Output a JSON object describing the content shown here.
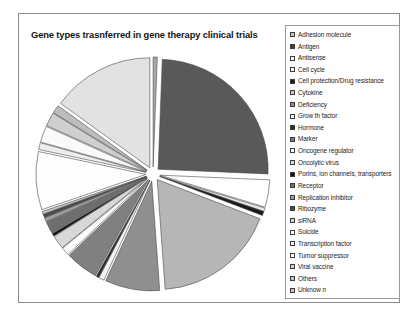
{
  "chart_data": {
    "type": "pie",
    "title": "Gene types  trasnferred in gene therapy clinical trials",
    "exploded": true,
    "legend_position": "right",
    "grid": false,
    "categories": [
      "Adhesion molecule",
      "Antigen",
      "Antisense",
      "Cell cycle",
      "Cell protection/Drug resistance",
      "Cytokine",
      "Deficiency",
      "Grow th factor",
      "Hormone",
      "Marker",
      "Oncogene regulator",
      "Oncolytic virus",
      "Porins, ion channels, transporters",
      "Receptor",
      "Replication inhibitor",
      "Ribozyme",
      "siRNA",
      "Suicide",
      "Transcription factor",
      "Tumor suppressor",
      "Viral vaccine",
      "Others",
      "Unknow n"
    ],
    "values": [
      0.6,
      25.0,
      4.0,
      0.5,
      0.6,
      18.0,
      8.0,
      0.8,
      0.4,
      4.8,
      1.2,
      2.0,
      0.4,
      1.8,
      0.6,
      0.5,
      0.4,
      8.5,
      1.0,
      2.4,
      2.0,
      1.2,
      15.0
    ],
    "colors": [
      "#a8a8a8",
      "#595959",
      "#ffffff",
      "#e8e8e8",
      "#1a1a1a",
      "#b6b6b6",
      "#8f8f8f",
      "#f2f2f2",
      "#2b2b2b",
      "#808080",
      "#fbfbfb",
      "#d8d8d8",
      "#111111",
      "#6e6e6e",
      "#9e9e9e",
      "#4a4a4a",
      "#c6c6c6",
      "#fdfdfd",
      "#ededed",
      "#fafafa",
      "#cfcfcf",
      "#bdbdbd",
      "#e2e2e2"
    ],
    "legend_swatches": [
      "#c4c4c4",
      "#3c3c3c",
      "#ffffff",
      "#ffffff",
      "#1a1a1a",
      "#c4c4c4",
      "#8f8f8f",
      "#ffffff",
      "#2b2b2b",
      "#7a7a7a",
      "#ffffff",
      "#d8d8d8",
      "#111111",
      "#6e6e6e",
      "#9e9e9e",
      "#4a4a4a",
      "#cfcfcf",
      "#ffffff",
      "#ffffff",
      "#ffffff",
      "#d2d2d2",
      "#c4c4c4",
      "#c4c4c4"
    ],
    "xlabel": "",
    "ylabel": ""
  }
}
